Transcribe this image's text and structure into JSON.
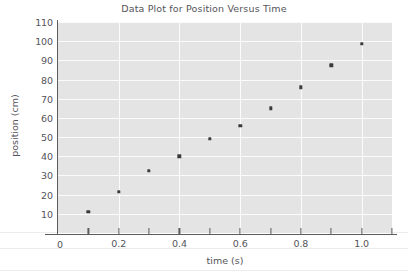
{
  "chart_data": {
    "type": "scatter",
    "title": "Data Plot for Position Versus Time",
    "xlabel": "time (s)",
    "ylabel": "position (cm)",
    "xlim": [
      0,
      1.1
    ],
    "ylim": [
      0,
      110
    ],
    "grid": true,
    "legend": "none",
    "x_major_ticks": [
      "0",
      "0.2",
      "0.4",
      "0.6",
      "0.8",
      "1.0"
    ],
    "x_major_tick_values": [
      0,
      0.2,
      0.4,
      0.6,
      0.8,
      1.0
    ],
    "x_minor_tick_values": [
      0.1,
      0.3,
      0.5,
      0.7,
      0.9,
      1.1
    ],
    "y_ticks": [
      "10",
      "20",
      "30",
      "40",
      "50",
      "60",
      "70",
      "80",
      "90",
      "100",
      "110"
    ],
    "y_tick_values": [
      10,
      20,
      30,
      40,
      50,
      60,
      70,
      80,
      90,
      100,
      110
    ],
    "y_origin_label": "0",
    "x": [
      0.1,
      0.2,
      0.3,
      0.4,
      0.5,
      0.6,
      0.7,
      0.8,
      0.9,
      1.0
    ],
    "values": [
      11,
      21.5,
      32.5,
      40,
      49,
      56,
      65,
      76,
      87.5,
      98.5
    ],
    "point_color": "#3b3b3b",
    "plot_background": "#e4e4e4",
    "gridline_color": "#fbfbfb",
    "axis_color": "#5c5c5c",
    "text_color": "#55545a"
  }
}
